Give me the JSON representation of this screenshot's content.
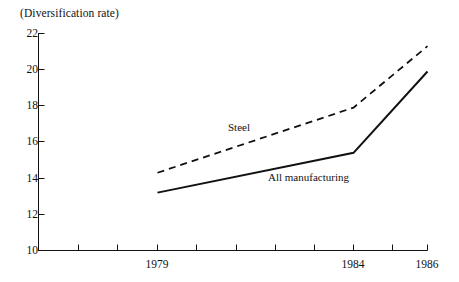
{
  "chart_data": {
    "type": "line",
    "title": "(Diversification rate)",
    "xlabel": "",
    "ylabel": "(Diversification rate)",
    "x": [
      1979,
      1984,
      1986
    ],
    "categories": [
      "1979",
      "1984",
      "1986"
    ],
    "series": [
      {
        "name": "Steel",
        "style": "dashed",
        "values": [
          14.3,
          17.9,
          21.3
        ]
      },
      {
        "name": "All manufacturing",
        "style": "solid",
        "values": [
          13.2,
          15.4,
          19.9
        ]
      }
    ],
    "ylim": [
      10,
      22
    ],
    "ytick_labels": [
      "10",
      "12",
      "14",
      "16",
      "18",
      "20",
      "22"
    ],
    "ytick_values": [
      10,
      12,
      14,
      16,
      18,
      20,
      22
    ],
    "xtick_labels": [
      "1979",
      "1984",
      "1986"
    ],
    "xlim": [
      1976.5,
      1986.5
    ],
    "grid": false,
    "legend": "inline-annotations",
    "line_color": "#111111",
    "axis_color": "#111111"
  },
  "annotations": {
    "steel_label": "Steel",
    "all_manufacturing_label": "All manufacturing"
  },
  "axis": {
    "title": "(Diversification rate)",
    "y_labels": [
      "22",
      "20",
      "18",
      "16",
      "14",
      "12",
      "10"
    ],
    "x_labels": [
      "1979",
      "1984",
      "1986"
    ]
  }
}
